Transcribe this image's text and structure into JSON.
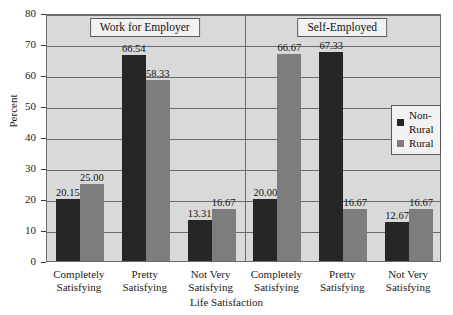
{
  "chart_data": {
    "type": "bar",
    "title": "",
    "xlabel": "Life Satisfaction",
    "ylabel": "Percent",
    "ylim": [
      0,
      80
    ],
    "yticks": [
      0,
      10,
      20,
      30,
      40,
      50,
      60,
      70,
      80
    ],
    "ytick_labels": [
      "0",
      "10",
      "20",
      "30",
      "40",
      "50",
      "60",
      "70",
      "80"
    ],
    "grid": "horizontal",
    "legend_position": "inside-right",
    "panels": [
      {
        "title": "Work for Employer",
        "categories": [
          "Completely Satisfying",
          "Pretty Satisfying",
          "Not Very Satisfying"
        ],
        "series": [
          {
            "name": "Non-Rural",
            "values": [
              20.15,
              66.54,
              13.31
            ],
            "labels": [
              "20.15",
              "66.54",
              "13.31"
            ],
            "color": "#262626"
          },
          {
            "name": "Rural",
            "values": [
              25.0,
              58.33,
              16.67
            ],
            "labels": [
              "25.00",
              "58.33",
              "16.67"
            ],
            "color": "#7d7d7d"
          }
        ]
      },
      {
        "title": "Self-Employed",
        "categories": [
          "Completely Satisfying",
          "Pretty Satisfying",
          "Not Very Satisfying"
        ],
        "series": [
          {
            "name": "Non-Rural",
            "values": [
              20.0,
              67.33,
              12.67
            ],
            "labels": [
              "20.00",
              "67.33",
              "12.67"
            ],
            "color": "#262626"
          },
          {
            "name": "Rural",
            "values": [
              66.67,
              16.67,
              16.67
            ],
            "labels": [
              "66.67",
              "16.67",
              "16.67"
            ],
            "color": "#7d7d7d"
          }
        ]
      }
    ],
    "legend": [
      {
        "name": "Non-Rural",
        "color": "#262626"
      },
      {
        "name": "Rural",
        "color": "#7d7d7d"
      }
    ],
    "xtick_labels": [
      {
        "line1": "Completely",
        "line2": "Satisfying"
      },
      {
        "line1": "Pretty",
        "line2": "Satisfying"
      },
      {
        "line1": "Not Very",
        "line2": "Satisfying"
      },
      {
        "line1": "Completely",
        "line2": "Satisfying"
      },
      {
        "line1": "Pretty",
        "line2": "Satisfying"
      },
      {
        "line1": "Not Very",
        "line2": "Satisfying"
      }
    ],
    "colors": {
      "plot_background": "#d9d9d9",
      "page_background": "#ffffff",
      "gridline": "#6b6b6b",
      "axis": "#3a3a3a",
      "text": "#1a1a1a"
    }
  }
}
